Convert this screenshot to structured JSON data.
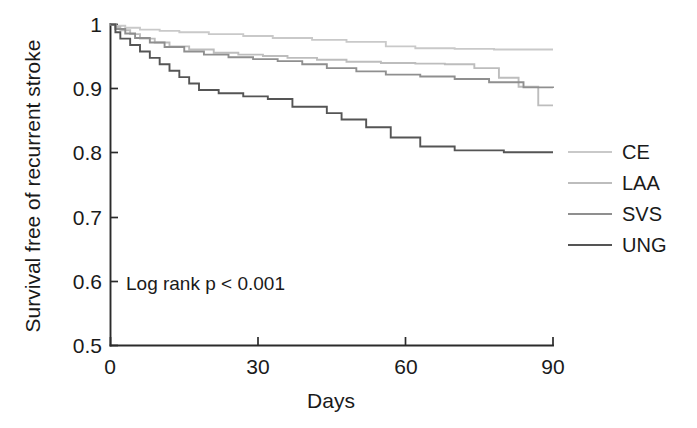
{
  "chart_data": {
    "type": "line",
    "title": "",
    "xlabel": "Days",
    "ylabel": "Survival free of recurrent stroke",
    "xlim": [
      0,
      90
    ],
    "ylim": [
      0.5,
      1
    ],
    "xticks": [
      0,
      30,
      60,
      90
    ],
    "xticklabels": [
      "0",
      "30",
      "60",
      "90"
    ],
    "yticks": [
      0.5,
      0.6,
      0.7,
      0.8,
      0.9,
      1
    ],
    "yticklabels": [
      "0.5",
      "0.6",
      "0.7",
      "0.8",
      "0.9",
      "1"
    ],
    "grid": false,
    "legend_position": "right",
    "annotation": "Log rank p < 0.001",
    "step_style": "post",
    "series": [
      {
        "name": "CE",
        "color": "#c9c9c9",
        "x": [
          0,
          1,
          3,
          6,
          10,
          14,
          20,
          27,
          33,
          41,
          48,
          56,
          62,
          70,
          78,
          85,
          90
        ],
        "y": [
          1.0,
          0.998,
          0.995,
          0.992,
          0.99,
          0.988,
          0.985,
          0.982,
          0.979,
          0.976,
          0.973,
          0.966,
          0.963,
          0.962,
          0.961,
          0.961,
          0.961
        ]
      },
      {
        "name": "LAA",
        "color": "#bdbdbd",
        "x": [
          0,
          1,
          2,
          4,
          6,
          9,
          12,
          16,
          21,
          26,
          31,
          36,
          42,
          48,
          55,
          62,
          68,
          74,
          79,
          83,
          87,
          90
        ],
        "y": [
          1.0,
          0.996,
          0.991,
          0.985,
          0.978,
          0.972,
          0.966,
          0.961,
          0.956,
          0.953,
          0.951,
          0.948,
          0.945,
          0.942,
          0.94,
          0.939,
          0.938,
          0.932,
          0.917,
          0.903,
          0.874,
          0.874
        ]
      },
      {
        "name": "SVS",
        "color": "#8f8f8f",
        "x": [
          0,
          1,
          3,
          5,
          8,
          11,
          15,
          19,
          24,
          29,
          34,
          39,
          44,
          50,
          56,
          63,
          70,
          77,
          84,
          90
        ],
        "y": [
          1.0,
          0.993,
          0.986,
          0.979,
          0.972,
          0.965,
          0.958,
          0.953,
          0.949,
          0.946,
          0.943,
          0.938,
          0.932,
          0.927,
          0.922,
          0.919,
          0.915,
          0.91,
          0.902,
          0.901
        ]
      },
      {
        "name": "UNG",
        "color": "#555555",
        "x": [
          0,
          1,
          2,
          4,
          6,
          8,
          10,
          12,
          14,
          16,
          18,
          22,
          27,
          32,
          37,
          41,
          44,
          47,
          52,
          57,
          63,
          70,
          80,
          90
        ],
        "y": [
          1.0,
          0.988,
          0.978,
          0.968,
          0.958,
          0.948,
          0.938,
          0.928,
          0.918,
          0.908,
          0.898,
          0.893,
          0.888,
          0.884,
          0.872,
          0.872,
          0.862,
          0.852,
          0.84,
          0.824,
          0.81,
          0.804,
          0.801,
          0.801
        ]
      }
    ]
  },
  "axes": {
    "x_title": "Days",
    "y_title": "Survival free of recurrent stroke"
  },
  "annotation": {
    "log_rank": "Log rank p < 0.001"
  },
  "legend": {
    "items": [
      {
        "label": "CE",
        "color": "#c9c9c9"
      },
      {
        "label": "LAA",
        "color": "#bdbdbd"
      },
      {
        "label": "SVS",
        "color": "#8f8f8f"
      },
      {
        "label": "UNG",
        "color": "#555555"
      }
    ]
  },
  "ticks": {
    "x": [
      "0",
      "30",
      "60",
      "90"
    ],
    "y": [
      "1",
      "0.9",
      "0.8",
      "0.7",
      "0.6",
      "0.5"
    ]
  }
}
